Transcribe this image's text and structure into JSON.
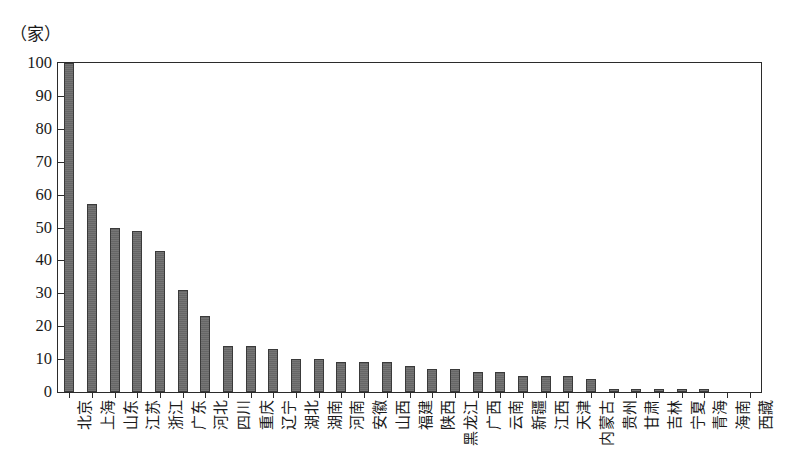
{
  "figure": {
    "unit_caption": "（家）",
    "background": "#ffffff",
    "frame_color": "#2b2b2b",
    "bar_color": "#666666",
    "bar_edge_color": "#3a3a3a"
  },
  "chart_data": {
    "type": "bar",
    "title": "",
    "subtitle": "",
    "xlabel": "",
    "ylabel": "（家）",
    "ylim": [
      0,
      100
    ],
    "yticks": [
      0,
      10,
      20,
      30,
      40,
      50,
      60,
      70,
      80,
      90,
      100
    ],
    "grid": false,
    "legend": null,
    "categories": [
      "北京",
      "上海",
      "山东",
      "江苏",
      "浙江",
      "广东",
      "河北",
      "四川",
      "重庆",
      "辽宁",
      "湖北",
      "湖南",
      "河南",
      "安徽",
      "山西",
      "福建",
      "陕西",
      "黑龙江",
      "广西",
      "云南",
      "新疆",
      "江西",
      "天津",
      "内蒙古",
      "贵州",
      "甘肃",
      "吉林",
      "宁夏",
      "青海",
      "海南",
      "西藏"
    ],
    "values": [
      100,
      57,
      50,
      49,
      43,
      31,
      23,
      14,
      14,
      13,
      10,
      10,
      9,
      9,
      9,
      8,
      7,
      7,
      6,
      6,
      5,
      5,
      5,
      4,
      1,
      1,
      1,
      1,
      1,
      0,
      0
    ]
  }
}
